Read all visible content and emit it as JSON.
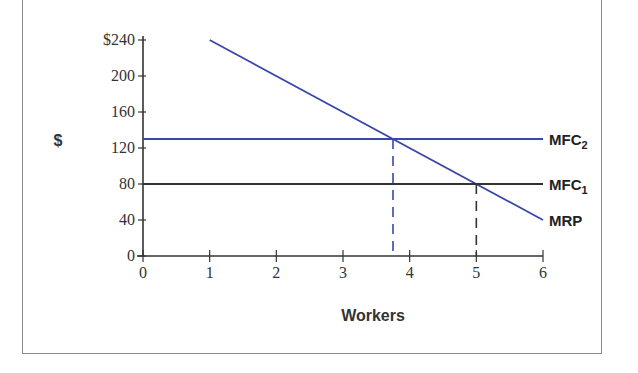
{
  "chart_data": {
    "type": "line",
    "title": "",
    "xlabel": "Workers",
    "ylabel": "$",
    "xlim": [
      0,
      6
    ],
    "ylim": [
      0,
      240
    ],
    "x_ticks": [
      "0",
      "1",
      "2",
      "3",
      "4",
      "5",
      "6"
    ],
    "y_ticks": [
      "0",
      "40",
      "80",
      "120",
      "160",
      "200",
      "$240"
    ],
    "y_tick_values": [
      0,
      40,
      80,
      120,
      160,
      200,
      240
    ],
    "x_tick_values": [
      0,
      1,
      2,
      3,
      4,
      5,
      6
    ],
    "grid": false,
    "series": [
      {
        "name": "MRP",
        "label": "MRP",
        "color": "#3a47a8",
        "x": [
          1,
          6
        ],
        "y": [
          240,
          40
        ]
      },
      {
        "name": "MFC2",
        "label_main": "MFC",
        "label_sub": "2",
        "color": "#3a47a8",
        "x": [
          0,
          6
        ],
        "y": [
          130,
          130
        ]
      },
      {
        "name": "MFC1",
        "label_main": "MFC",
        "label_sub": "1",
        "color": "#333333",
        "x": [
          0,
          6
        ],
        "y": [
          80,
          80
        ]
      }
    ],
    "annotations": [
      {
        "type": "dashed-vertical",
        "x": 3.75,
        "y_top": 130,
        "color": "#3a47a8",
        "note": "MRP = MFC2 intersection"
      },
      {
        "type": "dashed-vertical",
        "x": 5,
        "y_top": 80,
        "color": "#333333",
        "note": "MRP = MFC1 intersection"
      }
    ]
  }
}
